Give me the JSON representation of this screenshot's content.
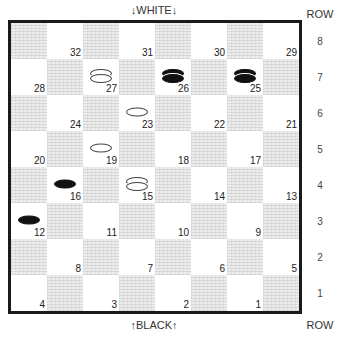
{
  "labels": {
    "top": "↓WHITE↓",
    "bottom": "↑BLACK↑",
    "row_header_top": "ROW",
    "row_header_bottom": "ROW"
  },
  "rows": [
    "8",
    "7",
    "6",
    "5",
    "4",
    "3",
    "2",
    "1"
  ],
  "squares": [
    {
      "num": "32",
      "row": 8,
      "col": 2
    },
    {
      "num": "31",
      "row": 8,
      "col": 4
    },
    {
      "num": "30",
      "row": 8,
      "col": 6
    },
    {
      "num": "29",
      "row": 8,
      "col": 8
    },
    {
      "num": "28",
      "row": 7,
      "col": 1
    },
    {
      "num": "27",
      "row": 7,
      "col": 3
    },
    {
      "num": "26",
      "row": 7,
      "col": 5
    },
    {
      "num": "25",
      "row": 7,
      "col": 7
    },
    {
      "num": "24",
      "row": 6,
      "col": 2
    },
    {
      "num": "23",
      "row": 6,
      "col": 4
    },
    {
      "num": "22",
      "row": 6,
      "col": 6
    },
    {
      "num": "21",
      "row": 6,
      "col": 8
    },
    {
      "num": "20",
      "row": 5,
      "col": 1
    },
    {
      "num": "19",
      "row": 5,
      "col": 3
    },
    {
      "num": "18",
      "row": 5,
      "col": 5
    },
    {
      "num": "17",
      "row": 5,
      "col": 7
    },
    {
      "num": "16",
      "row": 4,
      "col": 2
    },
    {
      "num": "15",
      "row": 4,
      "col": 4
    },
    {
      "num": "14",
      "row": 4,
      "col": 6
    },
    {
      "num": "13",
      "row": 4,
      "col": 8
    },
    {
      "num": "12",
      "row": 3,
      "col": 1
    },
    {
      "num": "11",
      "row": 3,
      "col": 3
    },
    {
      "num": "10",
      "row": 3,
      "col": 5
    },
    {
      "num": "9",
      "row": 3,
      "col": 7
    },
    {
      "num": "8",
      "row": 2,
      "col": 2
    },
    {
      "num": "7",
      "row": 2,
      "col": 4
    },
    {
      "num": "6",
      "row": 2,
      "col": 6
    },
    {
      "num": "5",
      "row": 2,
      "col": 8
    },
    {
      "num": "4",
      "row": 1,
      "col": 1
    },
    {
      "num": "3",
      "row": 1,
      "col": 3
    },
    {
      "num": "2",
      "row": 1,
      "col": 5
    },
    {
      "num": "1",
      "row": 1,
      "col": 7
    }
  ],
  "pieces": [
    {
      "square": "27",
      "color": "white",
      "king": true
    },
    {
      "square": "26",
      "color": "black",
      "king": true
    },
    {
      "square": "25",
      "color": "black",
      "king": true
    },
    {
      "square": "23",
      "color": "white",
      "king": false
    },
    {
      "square": "19",
      "color": "white",
      "king": false
    },
    {
      "square": "16",
      "color": "black",
      "king": false
    },
    {
      "square": "15",
      "color": "white",
      "king": true
    },
    {
      "square": "12",
      "color": "black",
      "king": false
    }
  ]
}
